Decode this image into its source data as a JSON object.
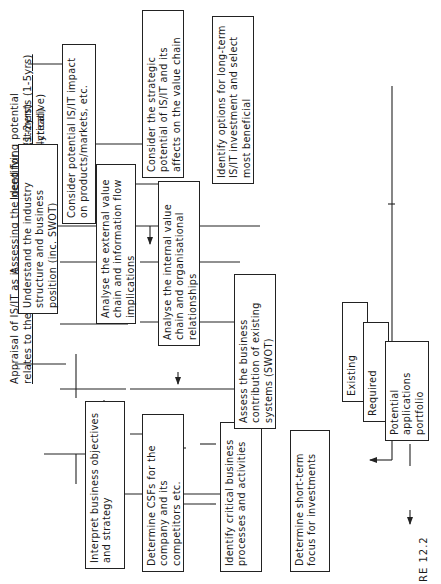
{
  "columns": [
    {
      "title_line1": "Assessing the need for",
      "title_line2": "immediate investments (1-2yrs)",
      "subtitle": "(short/medium term-analytical)"
    },
    {
      "title_line1": "Appraisal of IS/IT as it",
      "title_line2": "relates to the business",
      "subtitle": ""
    },
    {
      "title_line1": "Identifying potential",
      "title_line2": "future investments (1-5yrs)",
      "subtitle": "(long term-creative)"
    }
  ],
  "boxes": {
    "interpret": "Interpret business objectives and strategy",
    "csfs": "Determine CSFs for the company and its competitors etc.",
    "critical": "Identify critical business processes and activities",
    "short_term": "Determine short-term focus for investments",
    "industry": "Understand the industry structure and business position (inc. SWOT)",
    "external": "Analyse the external value chain and information flow implications",
    "internal": "Analyse the internal value chain and organisational relationships",
    "assess": "Assess the business contribution of existing systems (SWOT)",
    "impact": "Consider potential IS/IT impact on products/markets, etc.",
    "strategic": "Consider the strategic potential of IS/IT and its affects on the value chain",
    "options": "Identify options for long-term IS/IT investment and select most beneficial"
  },
  "portfolio": {
    "existing": "Existing",
    "required": "Required",
    "potential": "Potential applications portfolio"
  },
  "figure_label": "RE 12.2"
}
